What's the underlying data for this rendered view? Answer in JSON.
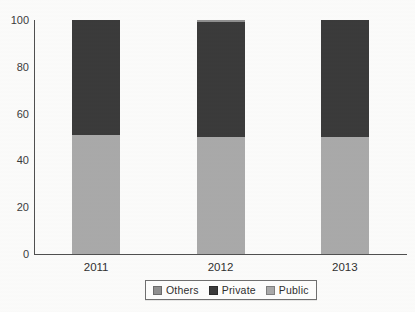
{
  "chart_data": {
    "type": "bar",
    "stacked": true,
    "title": "",
    "xlabel": "",
    "ylabel": "",
    "categories": [
      "2011",
      "2012",
      "2013"
    ],
    "series": [
      {
        "name": "Public",
        "color": "#a9a9a9",
        "values": [
          51,
          50,
          50
        ]
      },
      {
        "name": "Private",
        "color": "#3a3a3a",
        "values": [
          49,
          49,
          50
        ]
      },
      {
        "name": "Others",
        "color": "#8f8f8f",
        "values": [
          0,
          1,
          0
        ]
      }
    ],
    "legend_order": [
      "Others",
      "Private",
      "Public"
    ],
    "legend_position": "bottom",
    "ylim": [
      0,
      100
    ],
    "yticks": [
      0,
      20,
      40,
      60,
      80,
      100
    ],
    "grid": false
  },
  "colors": {
    "axis": "#4f4f4f",
    "text": "#333333",
    "background": "#fbfbfa",
    "legend_border": "#6f6f6f"
  }
}
